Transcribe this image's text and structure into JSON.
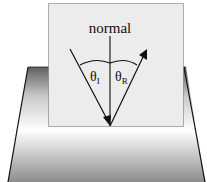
{
  "diagram": {
    "labels": {
      "normal": "normal",
      "theta_incident_base": "θ",
      "theta_incident_sub": "I",
      "theta_reflected_base": "θ",
      "theta_reflected_sub": "R"
    },
    "colors": {
      "card_fill": "#ececec",
      "card_border": "#555555",
      "ink": "#111111",
      "base_dark": "#6e6e6e",
      "base_light": "#ffffff",
      "base_bottom": "#9a9a9a"
    },
    "elements": [
      "reflecting surface (trapezoid base)",
      "vertical card",
      "normal line",
      "incident ray",
      "reflected ray",
      "angle arc"
    ]
  }
}
